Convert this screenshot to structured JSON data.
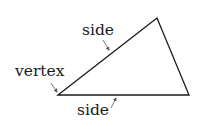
{
  "diagram": {
    "labels": {
      "side_top": "side",
      "vertex": "vertex",
      "side_bottom": "side"
    },
    "shape": {
      "type": "triangle",
      "vertices": [
        [
          58,
          95
        ],
        [
          157,
          18
        ],
        [
          189,
          95
        ]
      ]
    },
    "colors": {
      "stroke": "#1a1a1a",
      "arrow": "#555555",
      "background": "#ffffff"
    }
  }
}
